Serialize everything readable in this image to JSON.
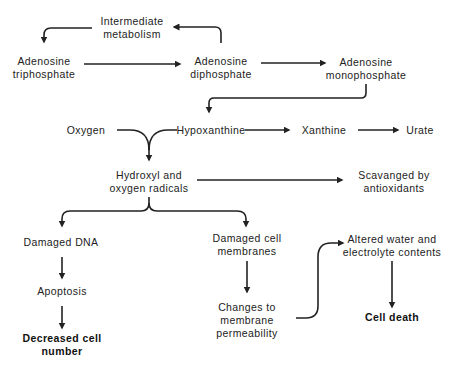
{
  "diagram": {
    "title": "",
    "nodes": {
      "intermediate_metabolism": {
        "line1": "Intermediate",
        "line2": "metabolism"
      },
      "atp": {
        "line1": "Adenosine",
        "line2": "triphosphate"
      },
      "adp": {
        "line1": "Adenosine",
        "line2": "diphosphate"
      },
      "amp": {
        "line1": "Adenosine",
        "line2": "monophosphate"
      },
      "oxygen": {
        "line1": "Oxygen"
      },
      "hypoxanthine": {
        "line1": "Hypoxanthine"
      },
      "xanthine": {
        "line1": "Xanthine"
      },
      "urate": {
        "line1": "Urate"
      },
      "radicals": {
        "line1": "Hydroxyl and",
        "line2": "oxygen radicals"
      },
      "scavenged": {
        "line1": "Scavanged by",
        "line2": "antioxidants"
      },
      "damaged_dna": {
        "line1": "Damaged DNA"
      },
      "apoptosis": {
        "line1": "Apoptosis"
      },
      "decreased_cell_number": {
        "line1": "Decreased cell",
        "line2": "number"
      },
      "damaged_membranes": {
        "line1": "Damaged cell",
        "line2": "membranes"
      },
      "permeability": {
        "line1": "Changes to",
        "line2": "membrane",
        "line3": "permeability"
      },
      "altered_water": {
        "line1": "Altered water and",
        "line2": "electrolyte contents"
      },
      "cell_death": {
        "line1": "Cell death"
      }
    },
    "edges": [
      {
        "from": "adp",
        "to": "intermediate_metabolism"
      },
      {
        "from": "intermediate_metabolism",
        "to": "atp"
      },
      {
        "from": "atp",
        "to": "adp"
      },
      {
        "from": "adp",
        "to": "amp"
      },
      {
        "from": "amp",
        "to": "hypoxanthine"
      },
      {
        "from": "hypoxanthine",
        "to": "xanthine"
      },
      {
        "from": "xanthine",
        "to": "urate"
      },
      {
        "from": "oxygen",
        "to": "radicals"
      },
      {
        "from": "hypoxanthine",
        "to": "radicals"
      },
      {
        "from": "radicals",
        "to": "scavenged"
      },
      {
        "from": "radicals",
        "to": "damaged_dna"
      },
      {
        "from": "radicals",
        "to": "damaged_membranes"
      },
      {
        "from": "damaged_dna",
        "to": "apoptosis"
      },
      {
        "from": "apoptosis",
        "to": "decreased_cell_number"
      },
      {
        "from": "damaged_membranes",
        "to": "permeability"
      },
      {
        "from": "permeability",
        "to": "altered_water"
      },
      {
        "from": "altered_water",
        "to": "cell_death"
      }
    ]
  }
}
